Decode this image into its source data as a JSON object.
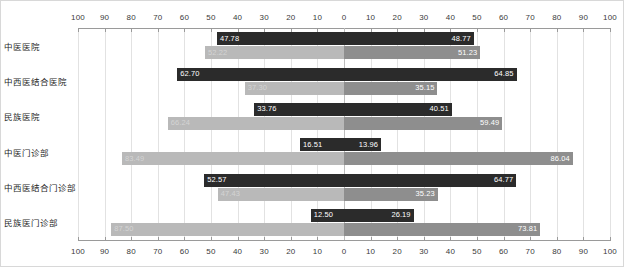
{
  "chart_data": {
    "type": "bar",
    "orientation": "horizontal",
    "style": "diverging-population-pyramid",
    "title": "",
    "xlabel": "",
    "ylabel": "",
    "grid": true,
    "legend": "none",
    "axis": {
      "left_ticks": [
        100,
        90,
        80,
        70,
        60,
        50,
        40,
        30,
        20,
        10,
        0
      ],
      "right_ticks": [
        0,
        10,
        20,
        30,
        40,
        50,
        60,
        70,
        80,
        90,
        100
      ],
      "range_each_side": [
        0,
        100
      ],
      "tick_step": 10,
      "ticks_top": true,
      "ticks_bottom": true
    },
    "categories": [
      "中医医院",
      "中西医结合医院",
      "民族医院",
      "中医门诊部",
      "中西医结合门诊部",
      "民族医门诊部"
    ],
    "series": [
      {
        "name": "left-dark",
        "side": "left",
        "color": "#2b2b2b",
        "values": [
          47.78,
          62.7,
          33.76,
          16.51,
          52.57,
          12.5
        ]
      },
      {
        "name": "left-light",
        "side": "left",
        "color": "#b9b9b9",
        "values": [
          52.22,
          37.3,
          66.24,
          83.49,
          47.43,
          87.5
        ]
      },
      {
        "name": "right-dark",
        "side": "right",
        "color": "#2b2b2b",
        "values": [
          48.77,
          64.85,
          40.51,
          13.96,
          64.77,
          26.19
        ]
      },
      {
        "name": "right-light",
        "side": "right",
        "color": "#8e8e8e",
        "values": [
          51.23,
          35.15,
          59.49,
          86.04,
          35.23,
          73.81
        ]
      }
    ],
    "value_labels": {
      "row1": {
        "left_dark": "47.78",
        "left_light": "52.22",
        "right_dark": "48.77",
        "right_light": "51.23"
      },
      "row2": {
        "left_dark": "62.70",
        "left_light": "37.30",
        "right_dark": "64.85",
        "right_light": "35.15"
      },
      "row3": {
        "left_dark": "33.76",
        "left_light": "66.24",
        "right_dark": "40.51",
        "right_light": "59.49"
      },
      "row4": {
        "left_dark": "16.51",
        "left_light": "83.49",
        "right_dark": "13.96",
        "right_light": "86.04"
      },
      "row5": {
        "left_dark": "52.57",
        "left_light": "47.43",
        "right_dark": "64.77",
        "right_light": "35.23"
      },
      "row6": {
        "left_dark": "12.50",
        "left_light": "87.50",
        "right_dark": "26.19",
        "right_light": "73.81"
      }
    },
    "colors": {
      "dark_bar": "#2b2b2b",
      "light_bar": "#8e8e8e",
      "pale_bar": "#b9b9b9",
      "gridline": "#e2e2e2",
      "axis": "#9a9a9a",
      "text": "#1f1f1f"
    }
  }
}
